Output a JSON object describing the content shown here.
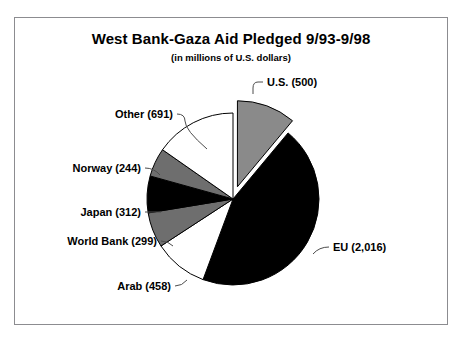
{
  "chart": {
    "title": "West Bank-Gaza Aid Pledged 9/93-9/98",
    "subtitle": "(in millions of U.S. dollars)"
  },
  "chart_data": {
    "type": "pie",
    "title": "West Bank-Gaza Aid Pledged 9/93-9/98",
    "subtitle": "(in millions of U.S. dollars)",
    "unit": "millions of U.S. dollars",
    "total": 4520,
    "legend": "none",
    "labels_position": "outside-with-leader-lines",
    "start_angle_deg": 0,
    "direction": "clockwise",
    "categories": [
      "U.S.",
      "EU",
      "Arab",
      "World Bank",
      "Japan",
      "Norway",
      "Other"
    ],
    "values": [
      500,
      2016,
      458,
      299,
      312,
      244,
      691
    ],
    "data_labels": [
      "U.S. (500)",
      "EU (2,016)",
      "Arab (458)",
      "World Bank (299)",
      "Japan (312)",
      "Norway (244)",
      "Other (691)"
    ],
    "slice_colors": [
      "#8a8a8a",
      "#000000",
      "#ffffff",
      "#6e6e6e",
      "#000000",
      "#6e6e6e",
      "#ffffff"
    ],
    "exploded": [
      "U.S."
    ]
  }
}
